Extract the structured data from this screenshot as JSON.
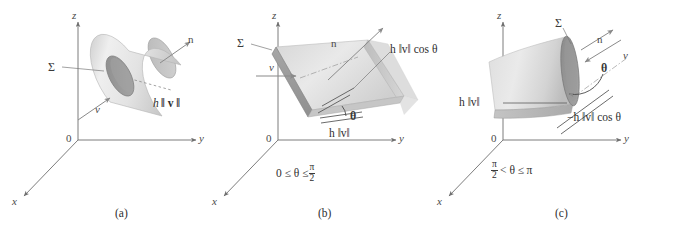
{
  "figure": {
    "colors": {
      "axis": "#6e6e6e",
      "surface_light": "#e2e2e2",
      "surface_mid": "#c9c9c9",
      "surface_dark": "#9a9a9a",
      "edge_dark": "#8a8a8a",
      "text": "#2e2e2e",
      "arrow": "#7a7a7a"
    }
  },
  "panels": [
    {
      "id": "a",
      "caption": "(a)",
      "axes": {
        "x": "x",
        "y": "y",
        "z": "z",
        "origin": "0"
      },
      "labels": {
        "sigma": "Σ",
        "normal": "n",
        "velocity": "v",
        "height_formula_h": "h",
        "height_formula_norm": "‖ v ‖",
        "height_formula_full": "h ‖v‖"
      },
      "condition": "",
      "shape": "cylinder"
    },
    {
      "id": "b",
      "caption": "(b)",
      "axes": {
        "x": "x",
        "y": "y",
        "z": "z",
        "origin": "0"
      },
      "labels": {
        "sigma": "Σ",
        "normal": "n",
        "velocity": "v",
        "theta": "θ",
        "slant_formula": "h ‖v‖ cos θ",
        "base_formula": "h ‖v‖"
      },
      "condition": {
        "left": "0 ≤ θ ≤",
        "frac_num": "π",
        "frac_den": "2",
        "full": "0 ≤ θ ≤ π/2"
      },
      "shape": "oblique-prism"
    },
    {
      "id": "c",
      "caption": "(c)",
      "axes": {
        "x": "x",
        "y": "y",
        "z": "z",
        "origin": "0"
      },
      "labels": {
        "sigma": "Σ",
        "normal": "n",
        "velocity": "v",
        "theta": "θ",
        "height_formula": "h ‖v‖",
        "projection_formula": "−h ‖v‖ cos θ"
      },
      "condition": {
        "frac_num": "π",
        "frac_den": "2",
        "mid": "< θ ≤",
        "right": "π",
        "full": "π/2 < θ ≤ π"
      },
      "shape": "curved-sheet"
    }
  ]
}
